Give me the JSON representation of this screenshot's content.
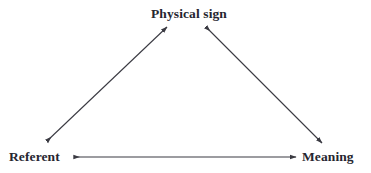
{
  "diagram": {
    "type": "semiotic-triangle",
    "background_color": "#ffffff",
    "line_color": "#3a3a42",
    "text_color": "#262630",
    "nodes": [
      {
        "id": "physical-sign",
        "label": "Physical sign",
        "position": "top-center"
      },
      {
        "id": "referent",
        "label": "Referent",
        "position": "bottom-left"
      },
      {
        "id": "meaning",
        "label": "Meaning",
        "position": "bottom-right"
      }
    ],
    "edges": [
      {
        "id": "referent-physical-sign",
        "from": "referent",
        "to": "physical-sign",
        "arrowheads": "both",
        "x1": 47,
        "y1": 141,
        "x2": 167,
        "y2": 27
      },
      {
        "id": "physical-sign-meaning",
        "from": "physical-sign",
        "to": "meaning",
        "arrowheads": "both",
        "x1": 206,
        "y1": 27,
        "x2": 322,
        "y2": 143
      },
      {
        "id": "referent-meaning",
        "from": "referent",
        "to": "meaning",
        "arrowheads": "both",
        "x1": 74,
        "y1": 157,
        "x2": 296,
        "y2": 157
      }
    ]
  }
}
